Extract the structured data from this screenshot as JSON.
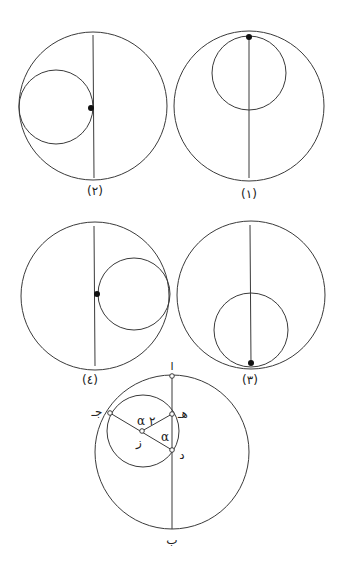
{
  "figures": [
    {
      "id": 1,
      "label": "(١)",
      "tangent_position": "top"
    },
    {
      "id": 2,
      "label": "(٢)",
      "tangent_position": "left"
    },
    {
      "id": 3,
      "label": "(٣)",
      "tangent_position": "bottom"
    },
    {
      "id": 4,
      "label": "(٤)",
      "tangent_position": "right"
    }
  ],
  "construction": {
    "points": {
      "a": "ا",
      "b": "ب",
      "j": "جـ",
      "h": "هـ",
      "z": "ز",
      "d": "د"
    },
    "angles": {
      "alpha": "α",
      "two_alpha": "α ٢"
    }
  },
  "colors": {
    "line": "#3a3a3a",
    "dot": "#111111",
    "background": "#ffffff"
  }
}
